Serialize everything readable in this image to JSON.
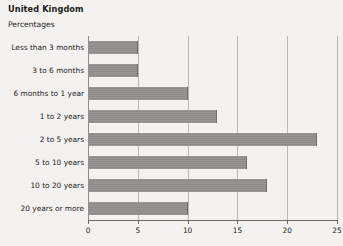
{
  "header": {
    "title": "United Kingdom",
    "subtitle": "Percentages"
  },
  "chart_data": {
    "type": "bar",
    "orientation": "horizontal",
    "title": "United Kingdom",
    "subtitle": "Percentages",
    "xlabel": "",
    "ylabel": "",
    "xlim": [
      0,
      25
    ],
    "xticks": [
      0,
      5,
      10,
      15,
      20,
      25
    ],
    "xticklabels": [
      "0",
      "5",
      "10",
      "15",
      "20",
      "25"
    ],
    "grid": true,
    "legend": false,
    "bar_color": "#8d8b89",
    "categories": [
      "Less than 3 months",
      "3 to 6 months",
      "6 months to 1 year",
      "1 to 2 years",
      "2 to 5 years",
      "5 to 10 years",
      "10 to 20 years",
      "20 years or more"
    ],
    "values": [
      5,
      5,
      10,
      13,
      23,
      16,
      18,
      10
    ]
  }
}
